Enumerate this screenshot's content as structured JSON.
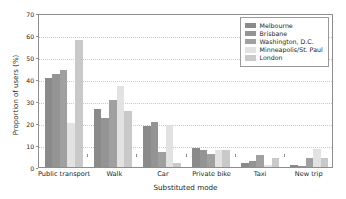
{
  "chart_data": {
    "type": "bar",
    "title": "",
    "xlabel": "Substituted mode",
    "ylabel": "Proportion of users (%)",
    "categories": [
      "Public transport",
      "Walk",
      "Car",
      "Private bike",
      "Taxi",
      "New trip"
    ],
    "ylim": [
      0,
      70
    ],
    "yticks": [
      0,
      10,
      20,
      30,
      40,
      50,
      60,
      70
    ],
    "ytick_labels": [
      "0",
      "10",
      "20",
      "30",
      "40",
      "50",
      "60",
      "70"
    ],
    "grid": "horizontal-dotted",
    "legend_position": "top-right",
    "series": [
      {
        "name": "Melbourne",
        "color": "#8a8a8a",
        "values": [
          40.6,
          26.5,
          18.5,
          8.7,
          1.9,
          0.9
        ]
      },
      {
        "name": "Brisbane",
        "color": "#949494",
        "values": [
          42.3,
          22.5,
          20.6,
          7.9,
          2.7,
          0.3
        ]
      },
      {
        "name": "Washington, D.C.",
        "color": "#a0a0a0",
        "values": [
          44.3,
          30.5,
          6.6,
          5.7,
          5.6,
          3.9
        ]
      },
      {
        "name": "Minneapolis/St. Paul",
        "color": "#e2e2e2",
        "values": [
          20.0,
          37.0,
          19.0,
          7.6,
          1.0,
          8.4
        ]
      },
      {
        "name": "London",
        "color": "#c9c9c9",
        "values": [
          57.7,
          25.6,
          1.8,
          7.6,
          3.9,
          4.0
        ]
      }
    ]
  },
  "legend": {
    "entries": [
      {
        "label": "Melbourne"
      },
      {
        "label": "Brisbane"
      },
      {
        "label": "Washington, D.C."
      },
      {
        "label": "Minneapolis/St. Paul"
      },
      {
        "label": "London"
      }
    ]
  }
}
